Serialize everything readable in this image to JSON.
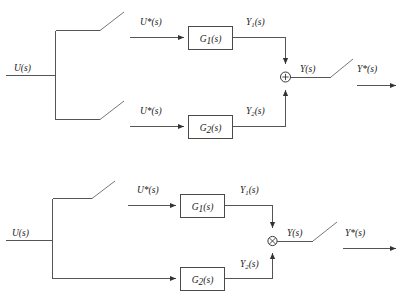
{
  "figure": {
    "type": "control-block-diagram",
    "line_color": "#555555",
    "box_stroke": "#4a4a4a",
    "text_color": "#1a1a1a",
    "background": "#ffffff"
  },
  "diagrams": [
    {
      "id": "top-diagram",
      "name": "parallel-sampled-inputs",
      "labels": {
        "input": "U(s)",
        "branch1_input": "U*(s)",
        "branch2_input": "U*(s)",
        "branch1_block": "G",
        "branch1_block_sub": "1",
        "branch1_block_tail": "(s)",
        "branch2_block": "G",
        "branch2_block_sub": "2",
        "branch2_block_tail": "(s)",
        "branch1_output": "Y",
        "branch1_output_sub": "1",
        "branch1_output_tail": "(s)",
        "branch2_output": "Y",
        "branch2_output_sub": "2",
        "branch2_output_tail": "(s)",
        "sum_output": "Y(s)",
        "sampled_output": "Y*(s)",
        "sum_sign": "+"
      },
      "switches": [
        "upper-branch-sampler",
        "lower-branch-sampler",
        "output-sampler"
      ],
      "switch_count": 3
    },
    {
      "id": "bottom-diagram",
      "name": "single-sampled-input",
      "labels": {
        "input": "U(s)",
        "branch1_input": "U*(s)",
        "branch1_block": "G",
        "branch1_block_sub": "1",
        "branch1_block_tail": "(s)",
        "branch2_block": "G",
        "branch2_block_sub": "2",
        "branch2_block_tail": "(s)",
        "branch1_output": "Y",
        "branch1_output_sub": "1",
        "branch1_output_tail": "(s)",
        "branch2_output": "Y",
        "branch2_output_sub": "2",
        "branch2_output_tail": "(s)",
        "sum_output": "Y(s)",
        "sampled_output": "Y*(s)"
      },
      "switches": [
        "upper-branch-sampler",
        "output-sampler"
      ],
      "switch_count": 2
    }
  ]
}
